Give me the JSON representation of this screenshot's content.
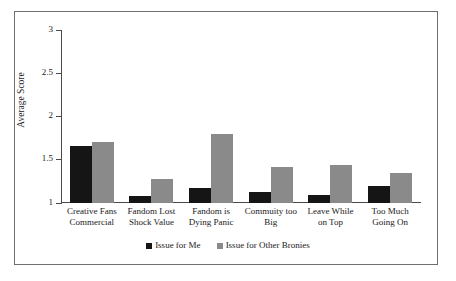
{
  "chart_data": {
    "type": "bar",
    "title": "",
    "subtitle": "",
    "xlabel": "",
    "ylabel": "Average Score",
    "ylim": [
      1,
      3
    ],
    "yticks": [
      "1",
      "1.5",
      "2",
      "2.5",
      "3"
    ],
    "ytick_values": [
      1,
      1.5,
      2,
      2.5,
      3
    ],
    "grid": false,
    "legend_position": "bottom-center",
    "categories": [
      "Creative Fans Commercial",
      "Fandom Lost Shock Value",
      "Fandom is Dying Panic",
      "Commuity too Big",
      "Leave While on Top",
      "Too Much Going On"
    ],
    "category_lines": [
      [
        "Creative Fans",
        "Commercial"
      ],
      [
        "Fandom Lost",
        "Shock Value"
      ],
      [
        "Fandom is",
        "Dying Panic"
      ],
      [
        "Commuity too",
        "Big"
      ],
      [
        "Leave While",
        "on Top"
      ],
      [
        "Too Much",
        "Going On"
      ]
    ],
    "series": [
      {
        "name": "Issue for Me",
        "color": "#151515",
        "values": [
          1.65,
          1.07,
          1.17,
          1.12,
          1.09,
          1.19
        ]
      },
      {
        "name": "Issue for Other Bronies",
        "color": "#8a8a8a",
        "values": [
          1.7,
          1.27,
          1.79,
          1.41,
          1.44,
          1.34
        ]
      }
    ]
  },
  "legend": {
    "items": [
      {
        "label": "Issue for Me",
        "swatch": "black-square-icon"
      },
      {
        "label": "Issue for Other Bronies",
        "swatch": "gray-square-icon"
      }
    ]
  }
}
